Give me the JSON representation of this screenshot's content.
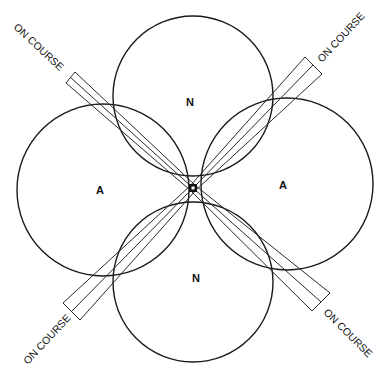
{
  "diagram": {
    "type": "radio-range-pattern",
    "lobes": [
      {
        "id": "top",
        "label": "N",
        "cx": 193,
        "cy": 96,
        "r": 80
      },
      {
        "id": "left",
        "label": "A",
        "cx": 103,
        "cy": 190,
        "r": 86
      },
      {
        "id": "bottom",
        "label": "N",
        "cx": 193,
        "cy": 282,
        "r": 80
      },
      {
        "id": "right",
        "label": "A",
        "cx": 287,
        "cy": 184,
        "r": 86
      }
    ],
    "center": {
      "x": 193,
      "y": 188
    },
    "courses": [
      {
        "id": "northwest",
        "label": "ON COURSE"
      },
      {
        "id": "northeast",
        "label": "ON COURSE"
      },
      {
        "id": "southwest",
        "label": "ON COURSE"
      },
      {
        "id": "southeast",
        "label": "ON COURSE"
      }
    ]
  }
}
